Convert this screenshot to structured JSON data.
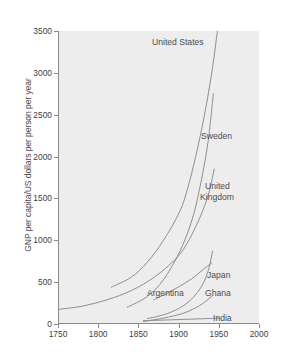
{
  "chart_data": {
    "type": "line",
    "title": "",
    "xlabel": "",
    "ylabel": "GNP per capita/US dollars per person per year",
    "xlim": [
      1750,
      2000
    ],
    "ylim": [
      0,
      3500
    ],
    "xticks": [
      1750,
      1800,
      1850,
      1900,
      1950,
      2000
    ],
    "yticks": [
      0,
      500,
      1000,
      1500,
      2000,
      2500,
      3000,
      3500
    ],
    "grid": false,
    "legend": "inline-labels",
    "background": "#ededed",
    "line_color": "#8e8e8e",
    "series": [
      {
        "name": "United States",
        "label": "United States",
        "x": [
          1815,
          1840,
          1860,
          1880,
          1900,
          1910,
          1920,
          1930,
          1940,
          1947
        ],
        "values": [
          440,
          560,
          740,
          1000,
          1340,
          1620,
          2000,
          2450,
          3000,
          3500
        ]
      },
      {
        "name": "Sweden",
        "label": "Sweden",
        "x": [
          1835,
          1860,
          1880,
          1900,
          1915,
          1925,
          1935,
          1942
        ],
        "values": [
          200,
          330,
          530,
          860,
          1230,
          1620,
          2150,
          2750
        ]
      },
      {
        "name": "United Kingdom",
        "label": "United Kingdom",
        "x": [
          1750,
          1780,
          1810,
          1840,
          1870,
          1900,
          1920,
          1935,
          1943
        ],
        "values": [
          175,
          215,
          290,
          400,
          570,
          830,
          1160,
          1520,
          1850
        ]
      },
      {
        "name": "Japan",
        "label": "Japan",
        "x": [
          1860,
          1880,
          1900,
          1915,
          1928,
          1936,
          1941
        ],
        "values": [
          65,
          110,
          190,
          300,
          460,
          650,
          870
        ]
      },
      {
        "name": "Argentina",
        "label": "Argentina",
        "x": [
          1868,
          1885,
          1900,
          1915,
          1928,
          1940
        ],
        "values": [
          290,
          370,
          450,
          540,
          640,
          730
        ]
      },
      {
        "name": "Ghana",
        "label": "Ghana",
        "x": [
          1855,
          1880,
          1905,
          1925,
          1940
        ],
        "values": [
          30,
          70,
          130,
          220,
          330
        ]
      },
      {
        "name": "India",
        "label": "India",
        "x": [
          1855,
          1890,
          1920,
          1950
        ],
        "values": [
          40,
          50,
          60,
          70
        ]
      }
    ]
  },
  "axis": {
    "y_title": "GNP per capita/US dollars per person per year",
    "y_tick_labels": [
      "3500",
      "3000",
      "2500",
      "2000",
      "1500",
      "1000",
      "500",
      "0"
    ],
    "x_tick_labels": [
      "1750",
      "1800",
      "1850",
      "1900",
      "1950",
      "2000"
    ]
  },
  "labels": {
    "united_states": "United States",
    "sweden": "Sweden",
    "united_kingdom_line1": "United",
    "united_kingdom_line2": "Kingdom",
    "japan": "Japan",
    "argentina": "Argentina",
    "ghana": "Ghana",
    "india": "India"
  }
}
